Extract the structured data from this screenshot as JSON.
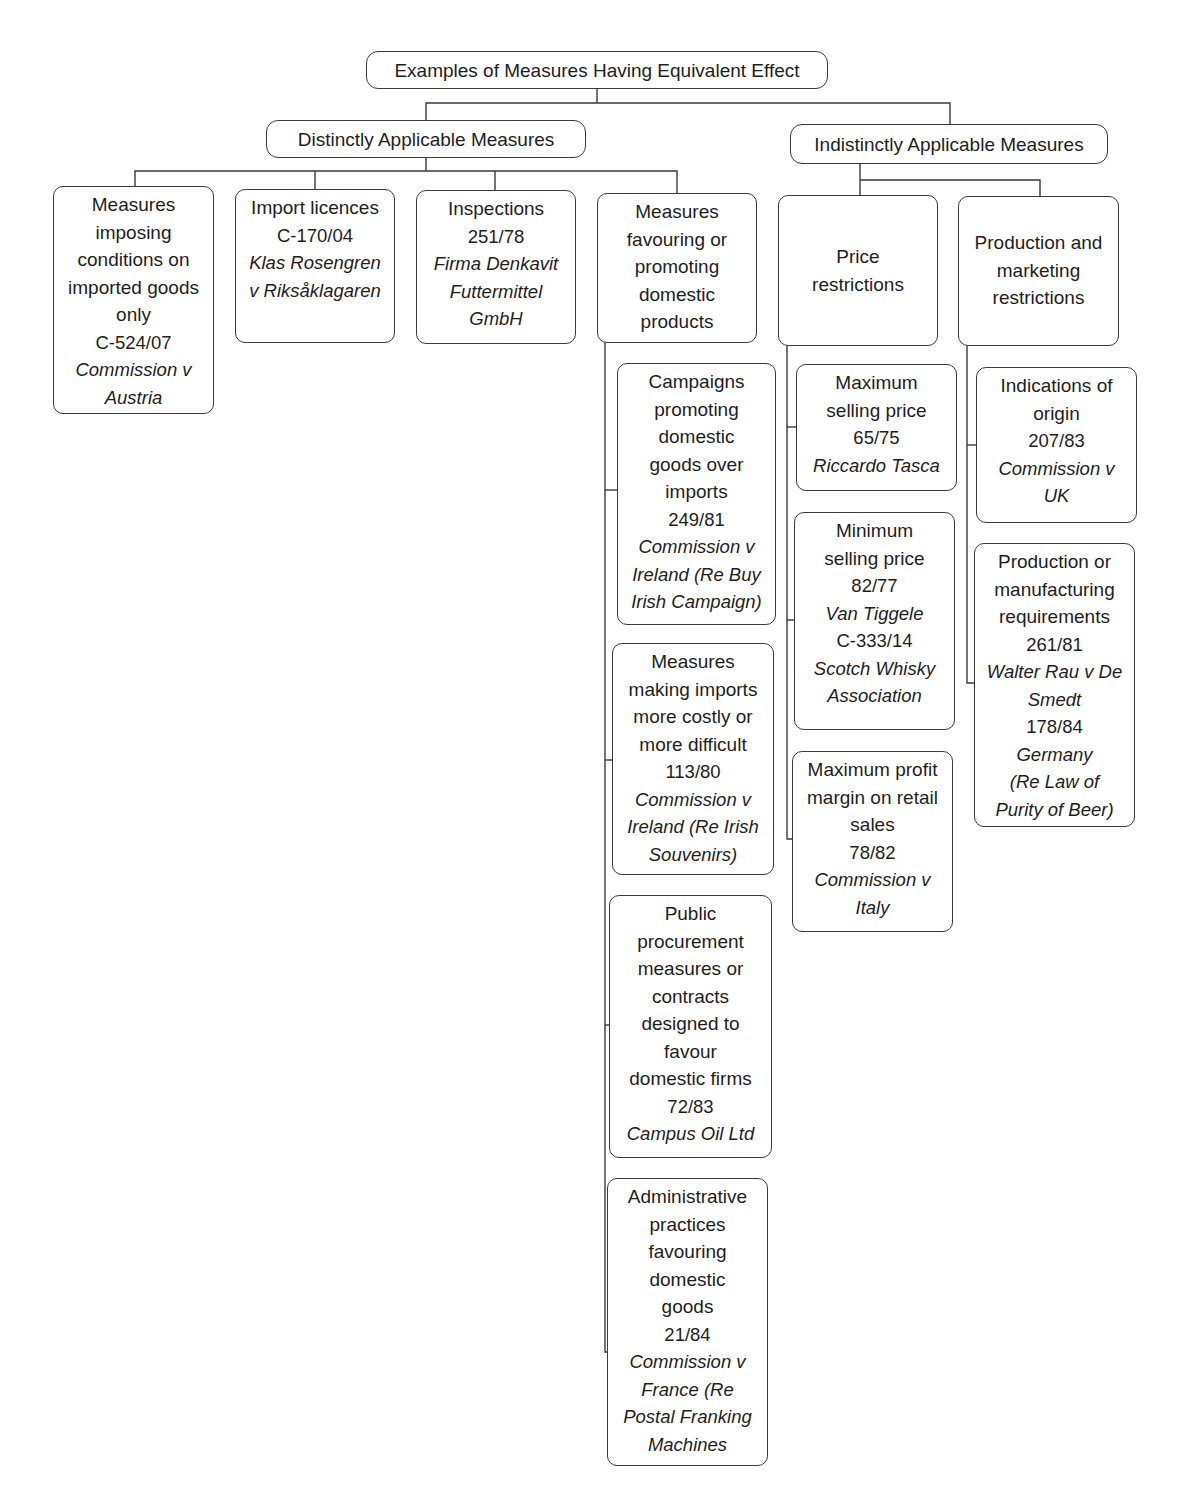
{
  "diagram": {
    "title": "Examples of Measures Having Equivalent Effect",
    "branches": [
      {
        "label": "Distinctly Applicable Measures",
        "children": [
          {
            "label_lines": [
              "Measures",
              "imposing",
              "conditions on",
              "imported goods",
              "only"
            ],
            "cases": [
              {
                "number": "C-524/07",
                "name_lines": [
                  "Commission v",
                  "Austria"
                ]
              }
            ]
          },
          {
            "label_lines": [
              "Import licences"
            ],
            "cases": [
              {
                "number": "C-170/04",
                "name_lines": [
                  "Klas Rosengren",
                  "v Riksåklagaren"
                ]
              }
            ]
          },
          {
            "label_lines": [
              "Inspections"
            ],
            "cases": [
              {
                "number": "251/78",
                "name_lines": [
                  "Firma Denkavit",
                  "Futtermittel",
                  "GmbH"
                ]
              }
            ]
          },
          {
            "label_lines": [
              "Measures",
              "favouring or",
              "promoting",
              "domestic",
              "products"
            ],
            "children": [
              {
                "label_lines": [
                  "Campaigns",
                  "promoting",
                  "domestic",
                  "goods over",
                  "imports"
                ],
                "cases": [
                  {
                    "number": "249/81",
                    "name_lines": [
                      "Commission v",
                      "Ireland (Re Buy",
                      "Irish Campaign)"
                    ]
                  }
                ]
              },
              {
                "label_lines": [
                  "Measures",
                  "making imports",
                  "more costly or",
                  "more difficult"
                ],
                "cases": [
                  {
                    "number": "113/80",
                    "name_lines": [
                      "Commission v",
                      "Ireland (Re Irish",
                      "Souvenirs)"
                    ]
                  }
                ]
              },
              {
                "label_lines": [
                  "Public",
                  "procurement",
                  "measures or",
                  "contracts",
                  "designed to",
                  "favour",
                  "domestic firms"
                ],
                "cases": [
                  {
                    "number": "72/83",
                    "name_lines": [
                      "Campus Oil Ltd"
                    ]
                  }
                ]
              },
              {
                "label_lines": [
                  "Administrative",
                  "practices",
                  "favouring",
                  "domestic",
                  "goods"
                ],
                "cases": [
                  {
                    "number": "21/84",
                    "name_lines": [
                      "Commission v",
                      "France (Re",
                      "Postal Franking",
                      "Machines"
                    ]
                  }
                ]
              }
            ]
          }
        ]
      },
      {
        "label": "Indistinctly Applicable Measures",
        "children": [
          {
            "label_lines": [
              "Price",
              "restrictions"
            ],
            "children": [
              {
                "label_lines": [
                  "Maximum",
                  "selling price"
                ],
                "cases": [
                  {
                    "number": "65/75",
                    "name_lines": [
                      "Riccardo Tasca"
                    ]
                  }
                ]
              },
              {
                "label_lines": [
                  "Minimum",
                  "selling price"
                ],
                "cases": [
                  {
                    "number": "82/77",
                    "name_lines": [
                      "Van Tiggele"
                    ]
                  },
                  {
                    "number": "C-333/14",
                    "name_lines": [
                      "Scotch Whisky",
                      "Association"
                    ]
                  }
                ]
              },
              {
                "label_lines": [
                  "Maximum profit",
                  "margin on retail",
                  "sales"
                ],
                "cases": [
                  {
                    "number": "78/82",
                    "name_lines": [
                      "Commission v",
                      "Italy"
                    ]
                  }
                ]
              }
            ]
          },
          {
            "label_lines": [
              "Production and",
              "marketing",
              "restrictions"
            ],
            "children": [
              {
                "label_lines": [
                  "Indications of",
                  "origin"
                ],
                "cases": [
                  {
                    "number": "207/83",
                    "name_lines": [
                      "Commission v",
                      "UK"
                    ]
                  }
                ]
              },
              {
                "label_lines": [
                  "Production or",
                  "manufacturing",
                  "requirements"
                ],
                "cases": [
                  {
                    "number": "261/81",
                    "name_lines": [
                      "Walter Rau v De",
                      "Smedt"
                    ]
                  },
                  {
                    "number": "178/84",
                    "name_lines": [
                      "Germany",
                      "(Re Law of",
                      "Purity of Beer)"
                    ]
                  }
                ]
              }
            ]
          }
        ]
      }
    ]
  }
}
